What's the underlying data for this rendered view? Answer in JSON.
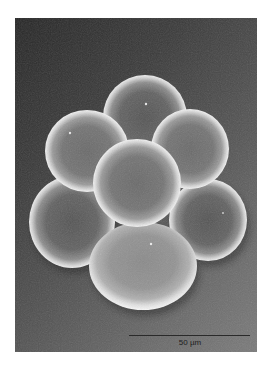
{
  "figure": {
    "type": "scanning-electron-micrograph",
    "scale_bar": {
      "label": "50 µm"
    },
    "colors": {
      "background_dark": "#262626",
      "background_light": "#7a7a7a",
      "sphere_rim": "#f2f2f2",
      "sphere_core": "#5e5e5e",
      "scale_bar": "#2a2a2a"
    },
    "spheres": [
      {
        "name": "top",
        "cx": 130,
        "cy": 99,
        "rx": 42,
        "ry": 42
      },
      {
        "name": "left-upper",
        "cx": 72,
        "cy": 133,
        "rx": 42,
        "ry": 41
      },
      {
        "name": "right-upper",
        "cx": 175,
        "cy": 131,
        "rx": 39,
        "ry": 40
      },
      {
        "name": "left-lower",
        "cx": 57,
        "cy": 204,
        "rx": 43,
        "ry": 46
      },
      {
        "name": "right-lower",
        "cx": 193,
        "cy": 202,
        "rx": 39,
        "ry": 41
      },
      {
        "name": "center-front",
        "cx": 122,
        "cy": 165,
        "rx": 44,
        "ry": 44
      },
      {
        "name": "bottom",
        "cx": 128,
        "cy": 248,
        "rx": 54,
        "ry": 44
      }
    ]
  }
}
